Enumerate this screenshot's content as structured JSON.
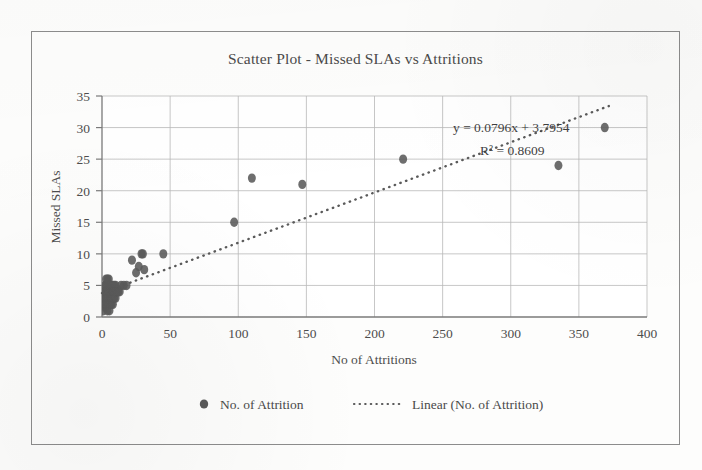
{
  "chart_data": {
    "type": "scatter",
    "title": "Scatter Plot - Missed SLAs vs Attritions",
    "xlabel": "No of Attritions",
    "ylabel": "Missed SLAs",
    "xlim": [
      0,
      400
    ],
    "ylim": [
      0,
      35
    ],
    "xticks": [
      "0",
      "50",
      "100",
      "150",
      "200",
      "250",
      "300",
      "350",
      "400"
    ],
    "yticks": [
      "0",
      "5",
      "10",
      "15",
      "20",
      "25",
      "30",
      "35"
    ],
    "grid": true,
    "legend_position": "bottom",
    "marker_color": "#5a5a5a",
    "trendline_color": "#5a5a5a",
    "series": [
      {
        "name": "No. of Attrition",
        "marker": "filled-circle",
        "points": [
          [
            1,
            1
          ],
          [
            1,
            2
          ],
          [
            1,
            3
          ],
          [
            1.5,
            4
          ],
          [
            2,
            2
          ],
          [
            2,
            3
          ],
          [
            2,
            4
          ],
          [
            2,
            5
          ],
          [
            2.5,
            1.5
          ],
          [
            3,
            2
          ],
          [
            3,
            3
          ],
          [
            3,
            4
          ],
          [
            3,
            5
          ],
          [
            3,
            6
          ],
          [
            3.5,
            2.5
          ],
          [
            4,
            1
          ],
          [
            4,
            2
          ],
          [
            4,
            3
          ],
          [
            4,
            4
          ],
          [
            4,
            5
          ],
          [
            4,
            6
          ],
          [
            4.5,
            3.5
          ],
          [
            5,
            2
          ],
          [
            5,
            3
          ],
          [
            5,
            4
          ],
          [
            5,
            5
          ],
          [
            5,
            6
          ],
          [
            5.5,
            1
          ],
          [
            5.5,
            4.5
          ],
          [
            6,
            2
          ],
          [
            6,
            3
          ],
          [
            6,
            4
          ],
          [
            6,
            5
          ],
          [
            6.5,
            3
          ],
          [
            7,
            2
          ],
          [
            7,
            3
          ],
          [
            7,
            4
          ],
          [
            7,
            5
          ],
          [
            7.5,
            3.5
          ],
          [
            8,
            2
          ],
          [
            8,
            3
          ],
          [
            8,
            4
          ],
          [
            8,
            5
          ],
          [
            8.5,
            4
          ],
          [
            9,
            3
          ],
          [
            9,
            4
          ],
          [
            9,
            5
          ],
          [
            10,
            3
          ],
          [
            10,
            4
          ],
          [
            10,
            5
          ],
          [
            11,
            4
          ],
          [
            12,
            4
          ],
          [
            13,
            4
          ],
          [
            14,
            5
          ],
          [
            16,
            5
          ],
          [
            18,
            5
          ],
          [
            22,
            9
          ],
          [
            25,
            7
          ],
          [
            27,
            8
          ],
          [
            29,
            10
          ],
          [
            30,
            10
          ],
          [
            31,
            7.5
          ],
          [
            45,
            10
          ],
          [
            97,
            15
          ],
          [
            110,
            22
          ],
          [
            147,
            21
          ],
          [
            221,
            25
          ],
          [
            335,
            24
          ],
          [
            369,
            30
          ]
        ]
      }
    ],
    "trendline": {
      "name": "Linear (No. of Attrition)",
      "style": "dotted",
      "equation": "y = 0.0796x + 3.7954",
      "r_squared": "R² = 0.8609",
      "slope": 0.0796,
      "intercept": 3.7954,
      "r2_value": 0.8609
    }
  },
  "legend": {
    "items": [
      {
        "label": "No. of Attrition",
        "marker": "filled-circle"
      },
      {
        "label": "Linear (No. of Attrition)",
        "marker": "dotted-line"
      }
    ]
  }
}
